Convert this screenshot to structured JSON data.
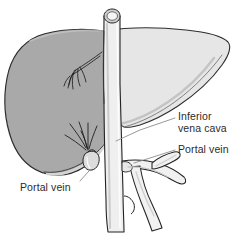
{
  "figure": {
    "background_color": "#ffffff"
  },
  "labels": {
    "inferior_vena_cava": {
      "line1": "Inferior",
      "line2": "vena cava"
    },
    "portal_vein_right": "Portal vein",
    "portal_vein_left": "Portal vein"
  },
  "anatomy": {
    "liver_left_lobe": {
      "name": "liver-left-lobe",
      "fill_color": "#a9a9a9",
      "outline_color": "#2e2e2e"
    },
    "liver_right_lobe": {
      "name": "liver-right-lobe",
      "fill_color": "#e6e6e6",
      "outline_color": "#2e2e2e"
    },
    "inferior_vena_cava": {
      "name": "inferior-vena-cava",
      "fill_color": "#efefef",
      "outline_color": "#232323"
    },
    "portal_vein": {
      "name": "portal-vein",
      "fill_color": "#f1f1f1",
      "outline_color": "#232323"
    },
    "gallbladder": {
      "name": "gallbladder",
      "fill_color": "#dcdcdc",
      "outline_color": "#232323"
    },
    "hepatic_vessels": {
      "name": "hepatic-vessel-branches",
      "stroke_color": "#1f1f1f"
    },
    "leader_lines": {
      "name": "leader-lines",
      "stroke_color": "#8c8c8c"
    }
  }
}
